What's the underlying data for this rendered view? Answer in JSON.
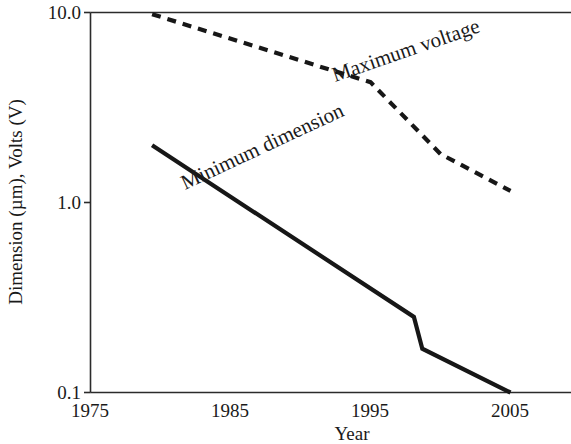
{
  "chart_data": {
    "type": "line",
    "title": "",
    "xlabel": "Year",
    "ylabel": "Dimension (µm), Volts (V)",
    "xlim": [
      1975,
      2008
    ],
    "ylim": [
      0.1,
      10.0
    ],
    "yscale": "log",
    "grid": false,
    "legend_position": "inline-annotations",
    "xticks": [
      "1975",
      "1985",
      "1995",
      "2005"
    ],
    "xtick_values": [
      1975,
      1985,
      1995,
      2005
    ],
    "yticks": [
      "10.0",
      "1.0",
      "0.1"
    ],
    "ytick_values": [
      10.0,
      1.0,
      0.1
    ],
    "series": [
      {
        "name": "Maximum voltage",
        "style": "dashed",
        "color": "#171717",
        "x": [
          1979.4,
          1992.1,
          1995.0,
          2000.0,
          2005.0
        ],
        "values": [
          9.8,
          5.0,
          4.3,
          1.8,
          1.15
        ]
      },
      {
        "name": "Minimum dimension",
        "style": "solid",
        "color": "#171717",
        "x": [
          1979.4,
          1998.1,
          1998.7,
          2005.0
        ],
        "values": [
          2.0,
          0.25,
          0.17,
          0.1
        ]
      }
    ],
    "annotations": [
      {
        "text": "Maximum voltage",
        "angle": -19
      },
      {
        "text": "Minimum dimension",
        "angle": -25
      }
    ]
  },
  "axes": {
    "y_label": "Dimension (µm), Volts (V)",
    "x_label": "Year",
    "y_tick_top": "10.0",
    "y_tick_mid": "1.0",
    "y_tick_bottom": "0.1",
    "x_tick_1": "1975",
    "x_tick_2": "1985",
    "x_tick_3": "1995",
    "x_tick_4": "2005"
  },
  "labels": {
    "max_voltage": "Maximum voltage",
    "min_dimension": "Minimum dimension"
  },
  "colors": {
    "ink": "#171717",
    "axis": "#2b2b2b",
    "background": "#ffffff"
  }
}
